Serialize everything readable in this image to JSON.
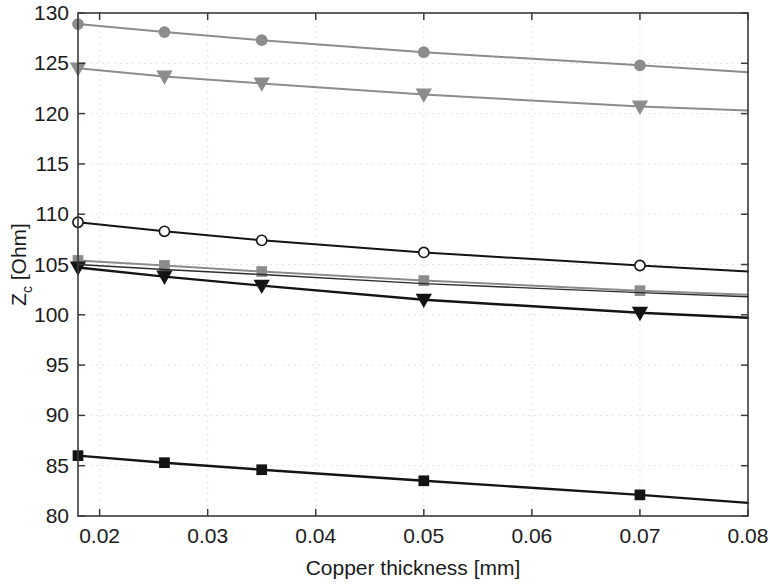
{
  "chart_data": {
    "type": "line",
    "title": "",
    "xlabel": "Copper thickness [mm]",
    "ylabel": "Z_c [Ohm]",
    "ylabel_base": "Z",
    "ylabel_subscript": "c",
    "ylabel_unit": " [Ohm]",
    "xlim": [
      0.018,
      0.08
    ],
    "ylim": [
      80,
      130
    ],
    "xticks": [
      0.02,
      0.03,
      0.04,
      0.05,
      0.06,
      0.07,
      0.08
    ],
    "xtick_labels": [
      "0.02",
      "0.03",
      "0.04",
      "0.05",
      "0.06",
      "0.07",
      "0.08"
    ],
    "yticks": [
      80,
      85,
      90,
      95,
      100,
      105,
      110,
      115,
      120,
      125,
      130
    ],
    "ytick_labels": [
      "80",
      "85",
      "90",
      "95",
      "100",
      "105",
      "110",
      "115",
      "120",
      "125",
      "130"
    ],
    "grid": true,
    "legend": "none",
    "marker_x": [
      0.018,
      0.026,
      0.035,
      0.05,
      0.07
    ],
    "x": [
      0.018,
      0.026,
      0.035,
      0.05,
      0.07,
      0.08
    ],
    "series": [
      {
        "name": "series-gray-circle",
        "marker": "circle",
        "color": "#8c8c8c",
        "fill": "#8c8c8c",
        "width": 2.0,
        "values": [
          128.9,
          128.1,
          127.3,
          126.1,
          124.8,
          124.1
        ]
      },
      {
        "name": "series-gray-triangle",
        "marker": "triangle",
        "color": "#8c8c8c",
        "fill": "#8c8c8c",
        "width": 2.0,
        "values": [
          124.5,
          123.7,
          123.0,
          121.9,
          120.7,
          120.3
        ]
      },
      {
        "name": "series-black-circle",
        "marker": "circle-open",
        "color": "#141414",
        "fill": "#ffffff",
        "width": 2.0,
        "values": [
          109.2,
          108.3,
          107.4,
          106.2,
          104.9,
          104.3
        ]
      },
      {
        "name": "series-gray-square",
        "marker": "square",
        "color": "#8c8c8c",
        "fill": "#8c8c8c",
        "width": 2.0,
        "values": [
          105.4,
          104.9,
          104.3,
          103.4,
          102.4,
          102.0
        ]
      },
      {
        "name": "series-black-thin",
        "marker": "none",
        "color": "#2b2b2b",
        "fill": "none",
        "width": 1.4,
        "values": [
          105.0,
          104.5,
          104.0,
          103.1,
          102.2,
          101.8
        ]
      },
      {
        "name": "series-black-triangle",
        "marker": "triangle",
        "color": "#141414",
        "fill": "#141414",
        "width": 2.4,
        "values": [
          104.7,
          103.8,
          102.9,
          101.5,
          100.2,
          99.7
        ]
      },
      {
        "name": "series-black-square",
        "marker": "square",
        "color": "#141414",
        "fill": "#141414",
        "width": 2.4,
        "values": [
          86.0,
          85.3,
          84.6,
          83.5,
          82.1,
          81.3
        ]
      }
    ]
  },
  "plot_area": {
    "left": 78,
    "top": 13,
    "right": 748,
    "bottom": 516
  }
}
